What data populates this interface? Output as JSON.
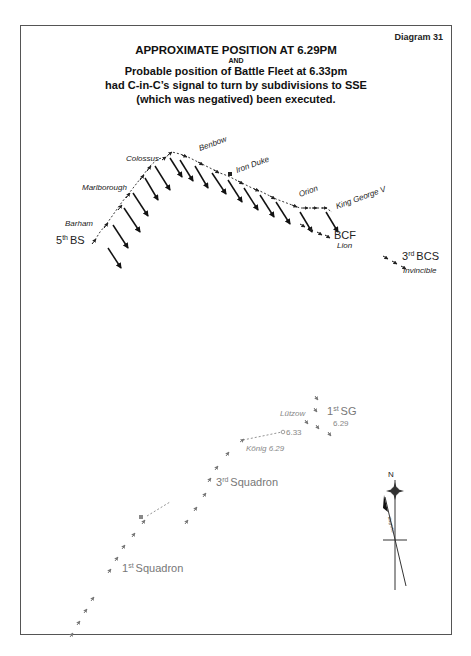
{
  "diagram": {
    "number_label": "Diagram 31",
    "title_line1": "APPROXIMATE POSITION AT 6.29PM",
    "title_and": "AND",
    "title_line2": "Probable position of Battle Fleet at 6.33pm",
    "title_line3": "had C-in-C’s signal to turn by subdivisions to SSE",
    "title_line4": "(which was negatived) been executed."
  },
  "british": {
    "ships": {
      "colossus": "Colossus",
      "benbow": "Benbow",
      "iron_duke": "Iron Duke",
      "marlborough": "Marlborough",
      "orion": "Orion",
      "king_george_v": "King George V",
      "barham": "Barham",
      "lion": "Lion",
      "invincible": "Invincible"
    },
    "units": {
      "fifth_bs": {
        "num": "5",
        "sup": "th",
        "name": "BS"
      },
      "bcf": "BCF",
      "third_bcs": {
        "num": "3",
        "sup": "rd",
        "name": "BCS"
      }
    }
  },
  "german": {
    "ships": {
      "lutzow": "Lützow",
      "konig": "König 6.29",
      "konig_633": "6.33"
    },
    "units": {
      "first_sg": {
        "num": "1",
        "sup": "st",
        "name": "SG"
      },
      "first_sg_time": "6.29",
      "third_squadron": {
        "num": "3",
        "sup": "rd",
        "name": "Squadron"
      },
      "first_squadron": {
        "num": "1",
        "sup": "st",
        "name": "Squadron"
      }
    }
  },
  "compass": {
    "north_label": "N",
    "magnetic_label": "Magnetic"
  },
  "colors": {
    "british": "#111111",
    "german": "#888888",
    "frame": "#555555"
  }
}
